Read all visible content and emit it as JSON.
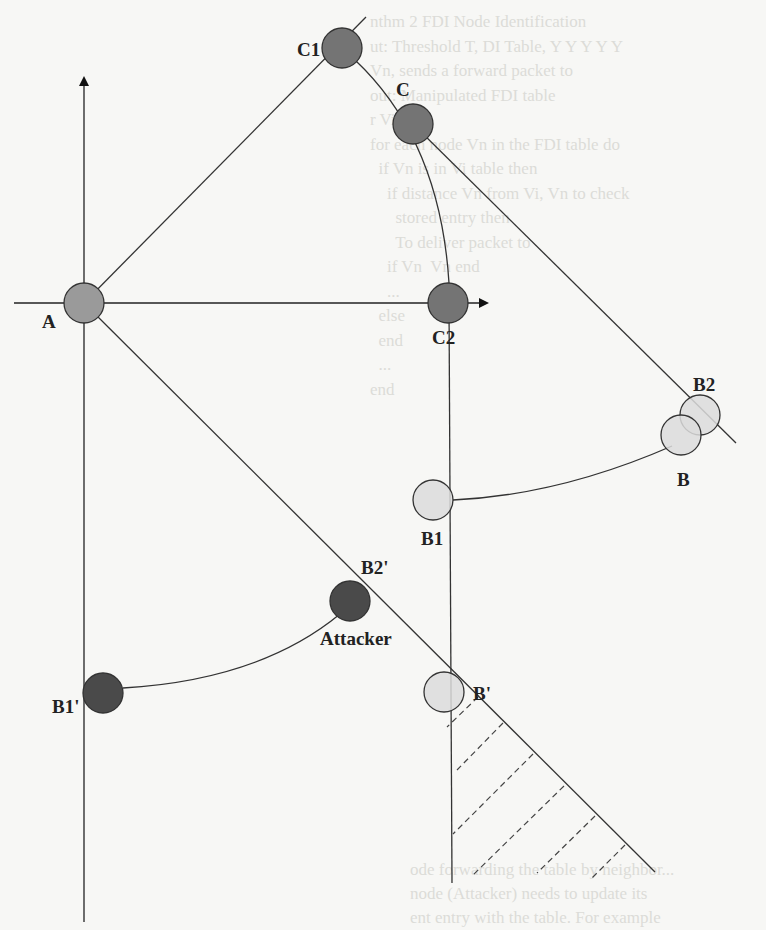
{
  "figure": {
    "type": "geometric diagram",
    "nodes": [
      {
        "id": "A",
        "label": "A",
        "cx": 84,
        "cy": 303,
        "r": 20,
        "fill": "#9a9a9a",
        "label_x": 42,
        "label_y": 328
      },
      {
        "id": "C1",
        "label": "C1",
        "cx": 342,
        "cy": 48,
        "r": 20,
        "fill": "#747474",
        "label_x": 297,
        "label_y": 56
      },
      {
        "id": "C",
        "label": "C",
        "cx": 413,
        "cy": 124,
        "r": 20,
        "fill": "#747474",
        "label_x": 396,
        "label_y": 96
      },
      {
        "id": "C2",
        "label": "C2",
        "cx": 448,
        "cy": 303,
        "r": 20,
        "fill": "#747474",
        "label_x": 432,
        "label_y": 344
      },
      {
        "id": "B2",
        "label": "B2",
        "cx": 700,
        "cy": 415,
        "r": 20,
        "fill": "#dcdcdc",
        "label_x": 693,
        "label_y": 391
      },
      {
        "id": "B",
        "label": "B",
        "cx": 681,
        "cy": 435,
        "r": 20,
        "fill": "#dcdcdc",
        "label_x": 677,
        "label_y": 486
      },
      {
        "id": "B1",
        "label": "B1",
        "cx": 433,
        "cy": 500,
        "r": 20,
        "fill": "#dcdcdc",
        "label_x": 421,
        "label_y": 545
      },
      {
        "id": "B2p",
        "label": "B2'",
        "cx": 350,
        "cy": 601,
        "r": 20,
        "fill": "#4a4a4a",
        "label_x": 361,
        "label_y": 574
      },
      {
        "id": "Attacker",
        "label": "Attacker",
        "cx": 350,
        "cy": 601,
        "r": 20,
        "fill": "#4a4a4a",
        "label_x": 320,
        "label_y": 645
      },
      {
        "id": "B1p",
        "label": "B1'",
        "cx": 103,
        "cy": 693,
        "r": 20,
        "fill": "#4a4a4a",
        "label_x": 52,
        "label_y": 713
      },
      {
        "id": "Bp",
        "label": "B'",
        "cx": 444,
        "cy": 692,
        "r": 20,
        "fill": "#dcdcdc",
        "label_x": 473,
        "label_y": 700
      }
    ],
    "axes": {
      "vertical": {
        "x": 84,
        "y_top": 78,
        "y_bottom": 922,
        "arrow": "up"
      },
      "horizontal": {
        "y": 303,
        "x_left": 14,
        "x_right": 487,
        "arrow": "right"
      }
    },
    "lines": [
      {
        "from": [
          84,
          303
        ],
        "to": [
          366,
          17
        ],
        "desc": "A to C1 ray"
      },
      {
        "from": [
          413,
          124
        ],
        "to": [
          736,
          443
        ],
        "desc": "C through B2"
      },
      {
        "from": [
          84,
          303
        ],
        "to": [
          655,
          872
        ],
        "desc": "A through B2' and B'"
      },
      {
        "from": [
          449,
          303
        ],
        "to": [
          452,
          883
        ],
        "desc": "C2 vertical"
      }
    ],
    "curves": [
      {
        "path": "M355,60 Q440,140 449,283",
        "desc": "arc C1-C-C2"
      },
      {
        "path": "M453,500 Q560,495 672,446",
        "desc": "B1 to B"
      },
      {
        "path": "M123,688 Q260,680 340,614",
        "desc": "B1' to Attacker"
      }
    ],
    "hatches": [
      [
        [
          478,
          697
        ],
        [
          447,
          727
        ]
      ],
      [
        [
          503,
          723
        ],
        [
          457,
          770
        ]
      ],
      [
        [
          533,
          754
        ],
        [
          453,
          834
        ]
      ],
      [
        [
          564,
          786
        ],
        [
          473,
          875
        ]
      ],
      [
        [
          595,
          816
        ],
        [
          537,
          873
        ]
      ],
      [
        [
          625,
          845
        ],
        [
          590,
          880
        ]
      ]
    ]
  },
  "bleed_text": {
    "lines": [
      "nthm 2 FDI Node Identification",
      "ut: Threshold T, DI Table, Y Y Y Y Y",
      "Vn, sends a forward packet to",
      "out: Manipulated FDI table",
      "r Vi then",
      "for each node Vn in the FDI table do",
      "  if Vn is in Vi table then",
      "    if distance Vn from Vi, Vn to check",
      "      stored entry then",
      "      To deliver packet to",
      "    if Vn  Vn end",
      "    ...",
      "  else",
      "  end",
      "  ...",
      "end"
    ],
    "bottom_lines": [
      "ode forwarding the table by neighbor...",
      "node (Attacker) needs to update its",
      "ent entry with the table. For example"
    ]
  }
}
